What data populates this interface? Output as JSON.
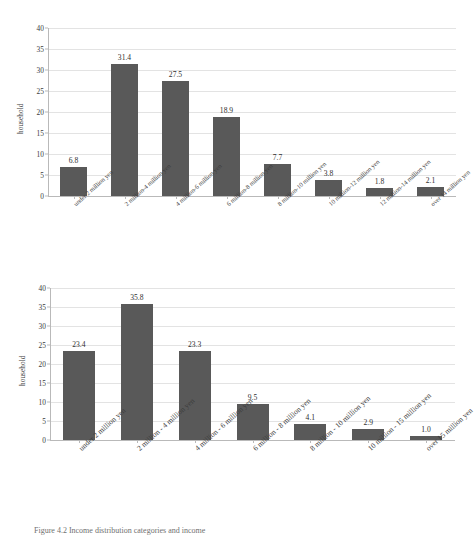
{
  "figure": {
    "caption": "Figure 4.2 Income distribution categories and income"
  },
  "chart_data": [
    {
      "id": "top",
      "type": "bar",
      "title": "",
      "xlabel": "",
      "ylabel": "household",
      "ylim": [
        0,
        40
      ],
      "yticks": [
        0,
        5,
        10,
        15,
        20,
        25,
        30,
        35,
        40
      ],
      "grid": true,
      "legend": "none",
      "bar_color": "#595959",
      "categories": [
        "under 2 million yen",
        "2 million-4 million yen",
        "4 million-6 million yen",
        "6 million-8 million yen",
        "8 million-10 million yen",
        "10 million-12 million yen",
        "12 million-14 million yen",
        "over 14 million yen"
      ],
      "values": [
        6.8,
        31.4,
        27.5,
        18.9,
        7.7,
        3.8,
        1.8,
        2.1
      ],
      "labels": [
        "6.8",
        "31.4",
        "27.5",
        "18.9",
        "7.7",
        "3.8",
        "1.8",
        "2.1"
      ]
    },
    {
      "id": "bottom",
      "type": "bar",
      "title": "",
      "xlabel": "",
      "ylabel": "household",
      "ylim": [
        0,
        40
      ],
      "yticks": [
        0,
        5,
        10,
        15,
        20,
        25,
        30,
        35,
        40
      ],
      "grid": true,
      "legend": "none",
      "bar_color": "#595959",
      "categories": [
        "under 2 million yen",
        "2 million - 4 million yen",
        "4 million - 6 million yen",
        "6 million - 8 million yen",
        "8 million - 10 million yen",
        "10 million - 15 million yen",
        "over 15 million yen"
      ],
      "values": [
        23.4,
        35.8,
        23.3,
        9.5,
        4.1,
        2.9,
        1.0
      ],
      "labels": [
        "23.4",
        "35.8",
        "23.3",
        "9.5",
        "4.1",
        "2.9",
        "1.0"
      ]
    }
  ]
}
